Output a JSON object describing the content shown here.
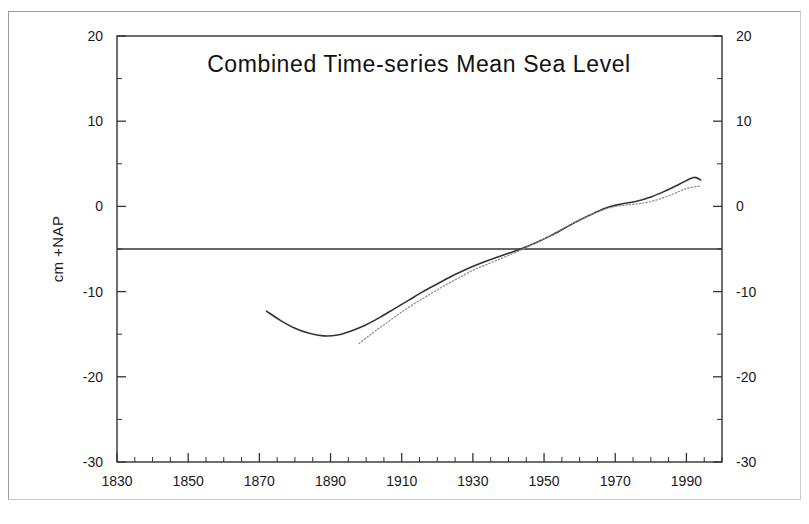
{
  "document": {
    "kind": "scanned-figure-page",
    "background_color": "#ffffff",
    "frame_color": "#9a9a9a"
  },
  "chart_data": {
    "type": "line",
    "title": "Combined Time-series Mean Sea Level",
    "xlabel": "",
    "ylabel": "cm +NAP",
    "xlim": [
      1830,
      2000
    ],
    "ylim": [
      -30,
      20
    ],
    "grid": false,
    "legend": null,
    "axes": {
      "left": {
        "label": "cm +NAP",
        "ticks": [
          20,
          10,
          0,
          -10,
          -20,
          -30
        ],
        "tick_labels": [
          "20",
          "10",
          "0",
          "-10",
          "-20",
          "-30"
        ],
        "minor_tick_step": 5
      },
      "right": {
        "label": "",
        "ticks": [
          20,
          10,
          0,
          -10,
          -20,
          -30
        ],
        "tick_labels": [
          "20",
          "10",
          "0",
          "-10",
          "-20",
          "-30"
        ],
        "minor_tick_step": 5
      },
      "bottom": {
        "ticks": [
          1830,
          1850,
          1870,
          1890,
          1910,
          1930,
          1950,
          1970,
          1990
        ],
        "tick_labels": [
          "1830",
          "1850",
          "1870",
          "1890",
          "1910",
          "1930",
          "1950",
          "1970",
          "1990"
        ],
        "minor_tick_step": 5
      }
    },
    "annotations": [
      {
        "name": "reference-line",
        "type": "hline",
        "y": -5,
        "style": "solid",
        "color": "#333333",
        "label": ""
      }
    ],
    "series": [
      {
        "name": "Combined mean sea level (solid)",
        "style": "solid",
        "color": "#333333",
        "x": [
          1872,
          1876,
          1880,
          1884,
          1888,
          1892,
          1896,
          1900,
          1904,
          1908,
          1912,
          1916,
          1920,
          1924,
          1928,
          1932,
          1936,
          1940,
          1944,
          1948,
          1952,
          1956,
          1960,
          1964,
          1968,
          1972,
          1976,
          1980,
          1984,
          1988,
          1992,
          1994
        ],
        "y": [
          -12.3,
          -13.4,
          -14.3,
          -14.9,
          -15.2,
          -15.1,
          -14.6,
          -13.9,
          -13.0,
          -12.0,
          -11.0,
          -10.0,
          -9.1,
          -8.2,
          -7.4,
          -6.7,
          -6.1,
          -5.5,
          -4.9,
          -4.2,
          -3.4,
          -2.5,
          -1.6,
          -0.8,
          -0.1,
          0.3,
          0.6,
          1.1,
          1.8,
          2.6,
          3.4,
          3.1
        ]
      },
      {
        "name": "Combined mean sea level (dotted)",
        "style": "dotted",
        "color": "#8a8a8a",
        "x": [
          1898,
          1902,
          1906,
          1910,
          1914,
          1918,
          1922,
          1926,
          1930,
          1934,
          1938,
          1942,
          1946,
          1950,
          1954,
          1958,
          1962,
          1966,
          1970,
          1974,
          1978,
          1982,
          1986,
          1990,
          1994
        ],
        "y": [
          -16.1,
          -14.8,
          -13.6,
          -12.4,
          -11.3,
          -10.3,
          -9.3,
          -8.4,
          -7.5,
          -6.8,
          -6.1,
          -5.4,
          -4.6,
          -3.8,
          -2.9,
          -2.0,
          -1.2,
          -0.5,
          0.0,
          0.2,
          0.4,
          0.8,
          1.4,
          2.1,
          2.4
        ]
      }
    ]
  }
}
